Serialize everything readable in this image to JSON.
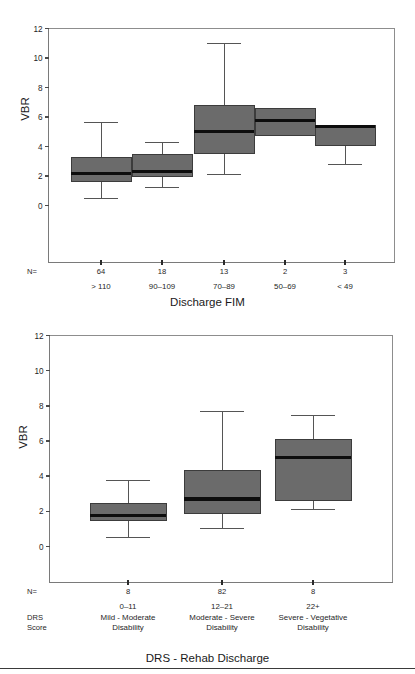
{
  "figure": {
    "background": "#ffffff",
    "box_fill": "#6b6b6b",
    "box_stroke": "#3c3c3c",
    "median_color": "#0d0d0d",
    "axis_color": "#7a7a7a",
    "text_color": "#1f1f1f"
  },
  "chart_data": [
    {
      "type": "box",
      "id": "discharge-fim",
      "title": "",
      "xlabel": "Discharge FIM",
      "ylabel": "VBR",
      "ylim": [
        0,
        12
      ],
      "yticks": [
        0,
        2,
        4,
        6,
        8,
        10,
        12
      ],
      "ytick_labels": [
        "0",
        "2",
        "4",
        "6",
        "8",
        "10",
        "12"
      ],
      "grid": false,
      "legend": "none",
      "n_prefix": "N=",
      "categories": [
        "> 110",
        "90–109",
        "70–89",
        "50–69",
        "< 49"
      ],
      "n_values": [
        "64",
        "18",
        "13",
        "2",
        "3"
      ],
      "boxes": [
        {
          "category": "> 110",
          "n": 64,
          "whisker_low": 0.5,
          "q1": 1.6,
          "median": 2.2,
          "q3": 3.25,
          "whisker_high": 5.6
        },
        {
          "category": "90–109",
          "n": 18,
          "whisker_low": 1.25,
          "q1": 2.0,
          "median": 2.3,
          "q3": 3.45,
          "whisker_high": 4.3
        },
        {
          "category": "70–89",
          "n": 13,
          "whisker_low": 2.1,
          "q1": 3.55,
          "median": 5.0,
          "q3": 6.8,
          "whisker_high": 10.95
        },
        {
          "category": "50–69",
          "n": 2,
          "whisker_low": 4.75,
          "q1": 4.75,
          "median": 5.75,
          "q3": 6.6,
          "whisker_high": 6.6
        },
        {
          "category": "< 49",
          "n": 3,
          "whisker_low": 2.75,
          "q1": 4.05,
          "median": 5.35,
          "q3": 5.45,
          "whisker_high": 5.45
        }
      ]
    },
    {
      "type": "box",
      "id": "drs-rehab-discharge",
      "title": "",
      "xlabel": "DRS - Rehab Discharge",
      "ylabel": "VBR",
      "ylim": [
        0,
        12
      ],
      "yticks": [
        0,
        2,
        4,
        6,
        8,
        10,
        12
      ],
      "ytick_labels": [
        "0",
        "2",
        "4",
        "6",
        "8",
        "10",
        "12"
      ],
      "grid": false,
      "legend": "none",
      "n_prefix": "N=",
      "score_prefix_line1": "DRS",
      "score_prefix_line2": "Score",
      "categories": [
        {
          "range": "0–11",
          "line1": "Mild - Moderate",
          "line2": "Disability"
        },
        {
          "range": "12–21",
          "line1": "Moderate - Severe",
          "line2": "Disability"
        },
        {
          "range": "22+",
          "line1": "Severe - Vegetative",
          "line2": "Disability"
        }
      ],
      "n_values": [
        "8",
        "82",
        "8"
      ],
      "boxes": [
        {
          "category": "0–11",
          "n": 8,
          "whisker_low": 0.5,
          "q1": 1.5,
          "median": 1.75,
          "q3": 2.45,
          "whisker_high": 3.75
        },
        {
          "category": "12–21",
          "n": 82,
          "whisker_low": 1.05,
          "q1": 1.9,
          "median": 2.7,
          "q3": 4.3,
          "whisker_high": 7.7
        },
        {
          "category": "22+",
          "n": 8,
          "whisker_low": 2.1,
          "q1": 2.6,
          "median": 5.05,
          "q3": 6.1,
          "whisker_high": 7.45
        }
      ]
    }
  ]
}
